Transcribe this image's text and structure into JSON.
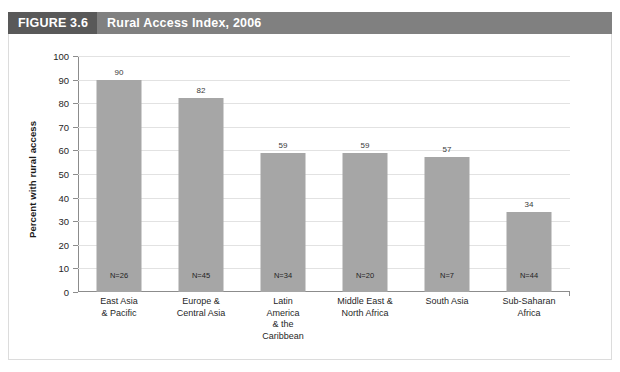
{
  "figure": {
    "number_label": "FIGURE 3.6",
    "title": "Rural Access Index, 2006"
  },
  "chart_data": {
    "type": "bar",
    "title": "Rural Access Index, 2006",
    "xlabel": "",
    "ylabel": "Percent with rural access",
    "ylim": [
      0,
      100
    ],
    "ytick_step": 10,
    "yticks": [
      100,
      90,
      80,
      70,
      60,
      50,
      40,
      30,
      20,
      10,
      0
    ],
    "grid": "horizontal",
    "legend": "none",
    "bar_color": "#a6a6a6",
    "categories": [
      "East Asia & Pacific",
      "Europe & Central Asia",
      "Latin America & the Caribbean",
      "Middle East & North Africa",
      "South Asia",
      "Sub-Saharan Africa"
    ],
    "category_lines": [
      [
        "East Asia",
        "& Pacific"
      ],
      [
        "Europe &",
        "Central Asia"
      ],
      [
        "Latin",
        "America",
        "& the",
        "Caribbean"
      ],
      [
        "Middle East &",
        "North Africa"
      ],
      [
        "South Asia"
      ],
      [
        "Sub-Saharan",
        "Africa"
      ]
    ],
    "values": [
      90,
      82,
      59,
      59,
      57,
      34
    ],
    "value_labels": [
      "90",
      "82",
      "59",
      "59",
      "57",
      "34"
    ],
    "annotations_in_bar": [
      "N=26",
      "N=45",
      "N=34",
      "N=20",
      "N=7",
      "N=44"
    ],
    "sample_sizes": [
      26,
      45,
      34,
      20,
      7,
      44
    ]
  },
  "colors": {
    "title_block_dark": "#595959",
    "title_block_light": "#808080",
    "title_text": "#ffffff",
    "bar": "#a6a6a6",
    "gridline": "#e2e2e2",
    "axis": "#8c8c8c"
  }
}
